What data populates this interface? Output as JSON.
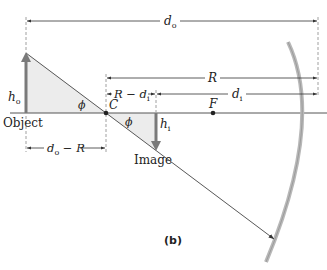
{
  "diagram": {
    "panel_label": "(b)",
    "labels": {
      "object": "Object",
      "image": "Image",
      "center": "C",
      "focal_point": "F",
      "angle_left": "ϕ",
      "angle_right": "ϕ",
      "object_height_main": "h",
      "object_height_sub": "o",
      "image_height_main": "h",
      "image_height_sub": "i"
    },
    "dimensions": {
      "d_o": {
        "main": "d",
        "sub": "o"
      },
      "R": {
        "main": "R"
      },
      "R_minus_d_i": {
        "pre": "R − ",
        "main": "d",
        "sub": "i"
      },
      "d_i": {
        "main": "d",
        "sub": "i"
      },
      "d_o_minus_R": {
        "main": "d",
        "sub": "o",
        "post": " − R"
      }
    },
    "colors": {
      "arrow_gray": "#7a7a7a",
      "shade": "#ececec",
      "line": "#444444",
      "mirror": "#b8b8b8"
    }
  }
}
